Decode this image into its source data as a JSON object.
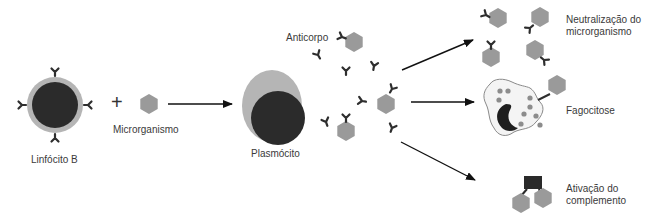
{
  "diagram": {
    "labels": {
      "b_cell": "Linfócito B",
      "plus": "+",
      "microorganism": "Microrganismo",
      "plasma_cell": "Plasmócito",
      "antibody": "Anticorpo",
      "neutralization_line1": "Neutralização do",
      "neutralization_line2": "microrganismo",
      "phagocytosis": "Fagocitose",
      "complement_line1": "Ativação do",
      "complement_line2": "complemento"
    },
    "colors": {
      "nucleus": "#2b2b2b",
      "cytoplasm": "#b5b5b5",
      "microbe": "#9a9a9a",
      "antibody": "#2e2e2e",
      "arrow": "#111111",
      "phagocyte_fill": "#f4f4f4",
      "phagocyte_outline": "#8a8a8a",
      "granule": "#8c8c8c",
      "complement": "#2a2a2a"
    }
  }
}
